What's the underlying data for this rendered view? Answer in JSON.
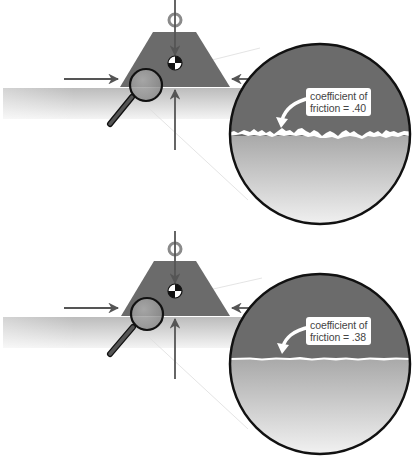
{
  "panels": [
    {
      "id": "high-friction",
      "label_line1": "coefficient of",
      "label_line2": "friction = .40",
      "coefficient": 0.4,
      "surface": "rough"
    },
    {
      "id": "low-friction",
      "label_line1": "coefficient of",
      "label_line2": "friction = .38",
      "coefficient": 0.38,
      "surface": "smooth"
    }
  ],
  "colors": {
    "block": "#6b6b6b",
    "ground_top": "#bdbdbd",
    "ground_bottom": "#f2f2f2",
    "arrow": "#555555",
    "outline": "#111111",
    "ring": "#8a8a8a",
    "background": "#ffffff"
  }
}
